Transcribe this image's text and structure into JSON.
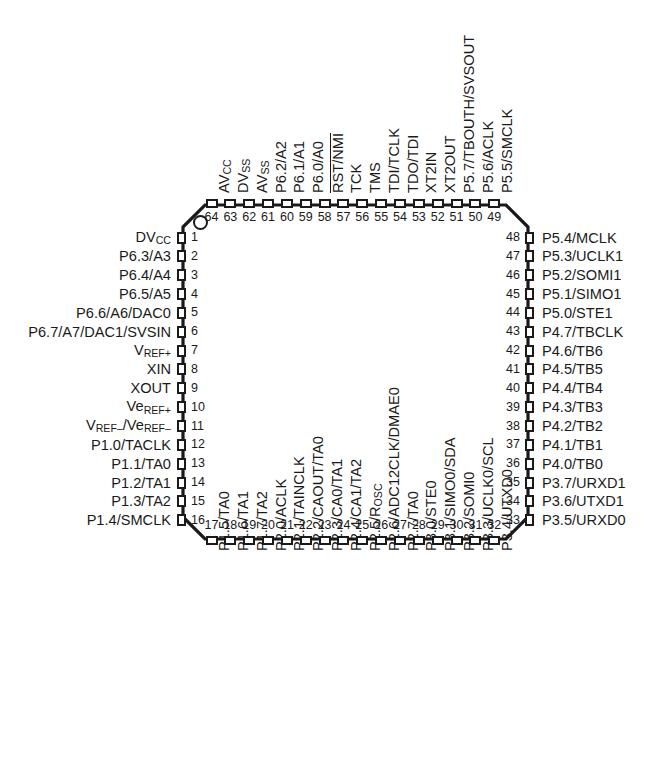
{
  "diagram": {
    "kind": "ic-pinout",
    "package": "64-pin PM quad flat package",
    "pin_count": 64,
    "pin1_indicator": "circle",
    "body_color": "#ffffff",
    "line_color": "#1a1a1a",
    "background": "#ffffff"
  },
  "left_pins": [
    {
      "num": "1",
      "label": "DV<sub>CC</sub>"
    },
    {
      "num": "2",
      "label": "P6.3/A3"
    },
    {
      "num": "3",
      "label": "P6.4/A4"
    },
    {
      "num": "4",
      "label": "P6.5/A5"
    },
    {
      "num": "5",
      "label": "P6.6/A6/DAC0"
    },
    {
      "num": "6",
      "label": "P6.7/A7/DAC1/SVSIN"
    },
    {
      "num": "7",
      "label": "V<sub>REF+</sub>"
    },
    {
      "num": "8",
      "label": "XIN"
    },
    {
      "num": "9",
      "label": "XOUT"
    },
    {
      "num": "10",
      "label": "Ve<sub>REF+</sub>"
    },
    {
      "num": "11",
      "label": "V<sub>REF–</sub>/Ve<sub>REF–</sub>"
    },
    {
      "num": "12",
      "label": "P1.0/TACLK"
    },
    {
      "num": "13",
      "label": "P1.1/TA0"
    },
    {
      "num": "14",
      "label": "P1.2/TA1"
    },
    {
      "num": "15",
      "label": "P1.3/TA2"
    },
    {
      "num": "16",
      "label": "P1.4/SMCLK"
    }
  ],
  "bottom_pins": [
    {
      "num": "17",
      "label": "P1.5/TA0"
    },
    {
      "num": "18",
      "label": "P1.6/TA1"
    },
    {
      "num": "19",
      "label": "P1.7/TA2"
    },
    {
      "num": "20",
      "label": "P2.0/ACLK"
    },
    {
      "num": "21",
      "label": "P2.1/TAINCLK"
    },
    {
      "num": "22",
      "label": "P2.2/CAOUT/TA0"
    },
    {
      "num": "23",
      "label": "P2.3/CA0/TA1"
    },
    {
      "num": "24",
      "label": "P2.4/CA1/TA2"
    },
    {
      "num": "25",
      "label": "P2.5/R<sub>OSC</sub>"
    },
    {
      "num": "26",
      "label": "P2.6/ADC12CLK/DMAE0"
    },
    {
      "num": "27",
      "label": "P2.7/TA0"
    },
    {
      "num": "28",
      "label": "P3.0/STE0"
    },
    {
      "num": "29",
      "label": "P3.1/SIMO0/SDA"
    },
    {
      "num": "30",
      "label": "P3.2/SOMI0"
    },
    {
      "num": "31",
      "label": "P3.3/UCLK0/SCL"
    },
    {
      "num": "32",
      "label": "P3.4/UTXD0"
    }
  ],
  "right_pins": [
    {
      "num": "33",
      "label": "P3.5/URXD0"
    },
    {
      "num": "34",
      "label": "P3.6/UTXD1"
    },
    {
      "num": "35",
      "label": "P3.7/URXD1"
    },
    {
      "num": "36",
      "label": "P4.0/TB0"
    },
    {
      "num": "37",
      "label": "P4.1/TB1"
    },
    {
      "num": "38",
      "label": "P4.2/TB2"
    },
    {
      "num": "39",
      "label": "P4.3/TB3"
    },
    {
      "num": "40",
      "label": "P4.4/TB4"
    },
    {
      "num": "41",
      "label": "P4.5/TB5"
    },
    {
      "num": "42",
      "label": "P4.6/TB6"
    },
    {
      "num": "43",
      "label": "P4.7/TBCLK"
    },
    {
      "num": "44",
      "label": "P5.0/STE1"
    },
    {
      "num": "45",
      "label": "P5.1/SIMO1"
    },
    {
      "num": "46",
      "label": "P5.2/SOMI1"
    },
    {
      "num": "47",
      "label": "P5.3/UCLK1"
    },
    {
      "num": "48",
      "label": "P5.4/MCLK"
    }
  ],
  "top_pins": [
    {
      "num": "49",
      "label": "P5.5/SMCLK"
    },
    {
      "num": "50",
      "label": "P5.6/ACLK"
    },
    {
      "num": "51",
      "label": "P5.7/TBOUTH/SVSOUT"
    },
    {
      "num": "52",
      "label": "XT2OUT"
    },
    {
      "num": "53",
      "label": "XT2IN"
    },
    {
      "num": "54",
      "label": "TDO/TDI"
    },
    {
      "num": "55",
      "label": "TDI/TCLK"
    },
    {
      "num": "56",
      "label": "TMS"
    },
    {
      "num": "57",
      "label": "TCK"
    },
    {
      "num": "58",
      "label": "RST/NMI",
      "overline": true
    },
    {
      "num": "59",
      "label": "P6.0/A0"
    },
    {
      "num": "60",
      "label": "P6.1/A1"
    },
    {
      "num": "61",
      "label": "P6.2/A2"
    },
    {
      "num": "62",
      "label": "AV<sub>SS</sub>"
    },
    {
      "num": "63",
      "label": "DV<sub>SS</sub>"
    },
    {
      "num": "64",
      "label": "AV<sub>CC</sub>"
    }
  ]
}
